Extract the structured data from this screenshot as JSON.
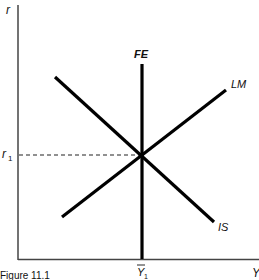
{
  "diagram": {
    "type": "IS-LM-FE economic model",
    "caption": "Figure 11.1",
    "axes": {
      "y_label": "r",
      "x_label": "Y"
    },
    "curves": [
      {
        "name": "IS",
        "label": "IS",
        "slope": "downward"
      },
      {
        "name": "LM",
        "label": "LM",
        "slope": "upward"
      },
      {
        "name": "FE",
        "label": "FE",
        "slope": "vertical"
      }
    ],
    "equilibrium": {
      "r_label": "r",
      "r_subscript": "1",
      "y_label": "Y",
      "y_subscript": "1",
      "y_bar": true
    }
  }
}
